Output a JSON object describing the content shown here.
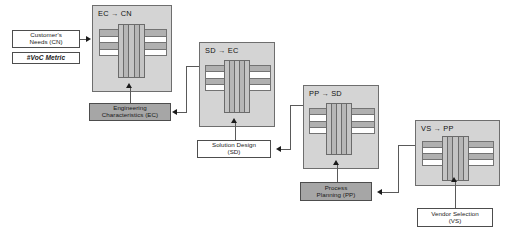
{
  "diagram": {
    "colors": {
      "panel_fill": "#d4d4d4",
      "panel_border": "#6e6e6e",
      "gray_box_fill": "#a6a6a6",
      "white_box_fill": "#ffffff",
      "box_border": "#4d4d4d",
      "connector": "#595959",
      "row_fill": "#b0b0b0",
      "col_fill": "#c4c4c4",
      "text": "#1a1a1a"
    },
    "arrow_glyph": "→"
  },
  "matrices": [
    {
      "id": "ec-cn",
      "source": "EC",
      "target": "CN",
      "title": "EC → CN",
      "rows": 4,
      "cols": 5
    },
    {
      "id": "sd-ec",
      "source": "SD",
      "target": "EC",
      "title": "SD → EC",
      "rows": 4,
      "cols": 5
    },
    {
      "id": "pp-sd",
      "source": "PP",
      "target": "SD",
      "title": "PP → SD",
      "rows": 4,
      "cols": 5
    },
    {
      "id": "vs-pp",
      "source": "VS",
      "target": "PP",
      "title": "VS → PP",
      "rows": 4,
      "cols": 5
    }
  ],
  "boxes": {
    "customer_needs": {
      "label": "Customer's\nNeeds (CN)",
      "line1": "Customer's",
      "line2": "Needs (CN)",
      "style": "white"
    },
    "voc_metric": {
      "label": "#VoC Metric",
      "style": "white-italic-bold"
    },
    "engineering_characteristics": {
      "line1": "Engineering",
      "line2": "Characteristics (EC)",
      "style": "gray"
    },
    "solution_design": {
      "line1": "Solution Design",
      "line2": "(SD)",
      "style": "white"
    },
    "process_planning": {
      "line1": "Process",
      "line2": "Planning (PP)",
      "style": "gray"
    },
    "vendor_selection": {
      "line1": "Vendor Selection",
      "line2": "(VS)",
      "style": "white"
    }
  }
}
